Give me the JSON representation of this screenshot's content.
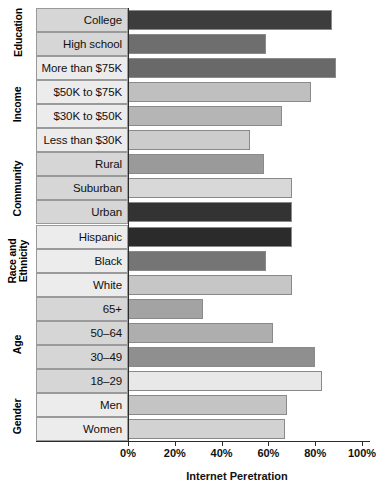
{
  "chart_data": {
    "type": "bar",
    "orientation": "horizontal",
    "title": "",
    "xlabel": "Internet Peretration",
    "ylabel": "",
    "xlim": [
      0,
      100
    ],
    "xticks": [
      "0%",
      "20%",
      "40%",
      "60%",
      "80%",
      "100%"
    ],
    "xtick_values": [
      0,
      20,
      40,
      60,
      80,
      100
    ],
    "grid": false,
    "legend": false,
    "categories": [
      "College",
      "High school",
      "More than $75K",
      "$50K to $75K",
      "$30K to $50K",
      "Less than $30K",
      "Rural",
      "Suburban",
      "Urban",
      "Hispanic",
      "Black",
      "White",
      "65+",
      "50–64",
      "30–49",
      "18–29",
      "Men",
      "Women"
    ],
    "values": [
      87,
      59,
      89,
      78,
      66,
      52,
      58,
      70,
      70,
      70,
      59,
      70,
      32,
      62,
      80,
      83,
      68,
      67
    ],
    "groups": [
      {
        "label": "Education",
        "rows": [
          {
            "label": "College",
            "value": 87,
            "color": "#3d3d3d"
          },
          {
            "label": "High school",
            "value": 59,
            "color": "#6e6e6e"
          }
        ]
      },
      {
        "label": "Income",
        "rows": [
          {
            "label": "More than $75K",
            "value": 89,
            "color": "#696969"
          },
          {
            "label": "$50K to $75K",
            "value": 78,
            "color": "#bfbfbf"
          },
          {
            "label": "$30K to $50K",
            "value": 66,
            "color": "#b5b5b5"
          },
          {
            "label": "Less than $30K",
            "value": 52,
            "color": "#cccccc"
          }
        ]
      },
      {
        "label": "Community",
        "rows": [
          {
            "label": "Rural",
            "value": 58,
            "color": "#9a9a9a"
          },
          {
            "label": "Suburban",
            "value": 70,
            "color": "#d8d8d8"
          },
          {
            "label": "Urban",
            "value": 70,
            "color": "#333333"
          }
        ]
      },
      {
        "label": "Race and\nEthnicity",
        "rows": [
          {
            "label": "Hispanic",
            "value": 70,
            "color": "#2b2b2b"
          },
          {
            "label": "Black",
            "value": 59,
            "color": "#757575"
          },
          {
            "label": "White",
            "value": 70,
            "color": "#c6c6c6"
          }
        ]
      },
      {
        "label": "Age",
        "rows": [
          {
            "label": "65+",
            "value": 32,
            "color": "#a3a3a3"
          },
          {
            "label": "50–64",
            "value": 62,
            "color": "#aeaeae"
          },
          {
            "label": "30–49",
            "value": 80,
            "color": "#8f8f8f"
          },
          {
            "label": "18–29",
            "value": 83,
            "color": "#e8e8e8"
          }
        ]
      },
      {
        "label": "Gender",
        "rows": [
          {
            "label": "Men",
            "value": 68,
            "color": "#c4c4c4"
          },
          {
            "label": "Women",
            "value": 67,
            "color": "#d2d2d2"
          }
        ]
      }
    ]
  },
  "axis": {
    "x_title": "Internet Peretration",
    "ticks": [
      "0%",
      "20%",
      "40%",
      "60%",
      "80%",
      "100%"
    ]
  },
  "colors": {
    "axis": "#2b2b2b",
    "bar_border": "#8a8a8a",
    "label_cell_border": "#9a9a9a",
    "background": "#ffffff"
  }
}
